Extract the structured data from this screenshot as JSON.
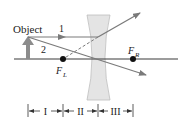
{
  "diagram": {
    "labels": {
      "object": "Object",
      "ray1": "1",
      "ray2": "2",
      "focal_left_main": "F",
      "focal_left_sub": "L",
      "focal_right_main": "F",
      "focal_right_sub": "R"
    },
    "regions": [
      {
        "label": "I"
      },
      {
        "label": "II"
      },
      {
        "label": "III"
      }
    ],
    "colors": {
      "axis": "#3a3a3a",
      "ray": "#7a7a7a",
      "object_arrow": "#8c8c8c",
      "lens_fill": "#e4e4e4",
      "lens_stroke": "#bdbdbd",
      "focal_point": "#111111",
      "text": "#222222"
    }
  }
}
